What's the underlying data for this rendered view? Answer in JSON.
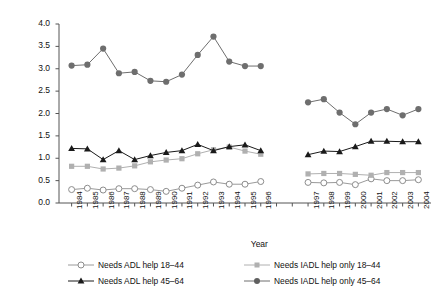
{
  "chart_data": {
    "type": "line",
    "title": "",
    "xlabel": "Year",
    "ylabel": "Percent",
    "ylim": [
      0.0,
      4.0
    ],
    "ytick_labels": [
      "0.0",
      "0.5",
      "1.0",
      "1.5",
      "2.0",
      "2.5",
      "3.0",
      "3.5",
      "4.0"
    ],
    "ytick_values": [
      0.0,
      0.5,
      1.0,
      1.5,
      2.0,
      2.5,
      3.0,
      3.5,
      4.0
    ],
    "grid": false,
    "legend_position": "bottom",
    "panels": [
      {
        "name": "panel-1984-1996",
        "categories": [
          "1984",
          "1985",
          "1986",
          "1987",
          "1988",
          "1989",
          "1990",
          "1991",
          "1992",
          "1993",
          "1994",
          "1995",
          "1996"
        ]
      },
      {
        "name": "panel-1997-2004",
        "categories": [
          "1997",
          "1998",
          "1999",
          "2000",
          "2001",
          "2002",
          "2003",
          "2004"
        ]
      }
    ],
    "x": [
      "1984",
      "1985",
      "1986",
      "1987",
      "1988",
      "1989",
      "1990",
      "1991",
      "1992",
      "1993",
      "1994",
      "1995",
      "1996",
      "1997",
      "1998",
      "1999",
      "2000",
      "2001",
      "2002",
      "2003",
      "2004"
    ],
    "series": [
      {
        "name": "Needs ADL help 18–44",
        "marker": "open-circle",
        "color": "#9a9a9a",
        "values_panel1": [
          0.3,
          0.33,
          0.29,
          0.32,
          0.32,
          0.3,
          0.26,
          0.33,
          0.4,
          0.47,
          0.42,
          0.42,
          0.48
        ],
        "values_panel2": [
          0.46,
          0.45,
          0.46,
          0.41,
          0.54,
          0.5,
          0.5,
          0.52
        ]
      },
      {
        "name": "Needs ADL help 45–64",
        "marker": "filled-triangle",
        "color": "#1a1a1a",
        "values_panel1": [
          1.22,
          1.21,
          0.97,
          1.17,
          0.97,
          1.06,
          1.13,
          1.17,
          1.31,
          1.17,
          1.26,
          1.3,
          1.17
        ],
        "values_panel2": [
          1.08,
          1.16,
          1.15,
          1.26,
          1.38,
          1.38,
          1.37,
          1.37
        ]
      },
      {
        "name": "Needs IADL help only 18–44",
        "marker": "filled-square",
        "color": "#b0b0b0",
        "values_panel1": [
          0.82,
          0.82,
          0.76,
          0.78,
          0.83,
          0.92,
          0.96,
          0.99,
          1.1,
          1.19,
          1.25,
          1.16,
          1.09
        ],
        "values_panel2": [
          0.65,
          0.66,
          0.66,
          0.64,
          0.62,
          0.68,
          0.68,
          0.68
        ]
      },
      {
        "name": "Needs IADL help only 45–64",
        "marker": "filled-circle",
        "color": "#6e6e6e",
        "values_panel1": [
          3.07,
          3.09,
          3.45,
          2.9,
          2.93,
          2.73,
          2.71,
          2.87,
          3.31,
          3.72,
          3.16,
          3.06,
          3.06
        ],
        "values_panel2": [
          2.25,
          2.32,
          2.02,
          1.76,
          2.02,
          2.1,
          1.96,
          2.1
        ]
      }
    ]
  },
  "legend": {
    "items": [
      {
        "label": "Needs ADL help 18–44"
      },
      {
        "label": "Needs IADL help only 18–44"
      },
      {
        "label": "Needs ADL help 45–64"
      },
      {
        "label": "Needs IADL help only 45–64"
      }
    ]
  }
}
